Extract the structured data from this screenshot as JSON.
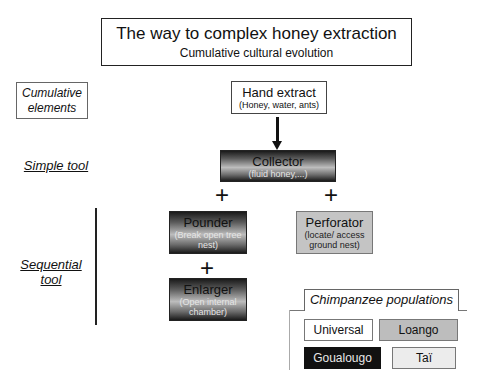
{
  "header": {
    "title": "The way to complex honey extraction",
    "subtitle": "Cumulative cultural evolution"
  },
  "side_labels": {
    "cumulative_elements_line1": "Cumulative",
    "cumulative_elements_line2": "elements",
    "simple_tool": "Simple tool",
    "sequential_tool_line1": "Sequential",
    "sequential_tool_line2": "tool"
  },
  "nodes": {
    "hand_extract": {
      "title": "Hand extract",
      "sub": "(Honey, water, ants)",
      "population": "Universal"
    },
    "collector": {
      "title": "Collector",
      "sub": "(fluid honey,...)",
      "population": "Taï / gradient"
    },
    "pounder": {
      "title": "Pounder",
      "sub_line1": "(Break open tree",
      "sub_line2": "nest)"
    },
    "perforator": {
      "title": "Perforator",
      "sub_line1": "(locate/ access",
      "sub_line2": "ground nest)",
      "population": "Loango"
    },
    "enlarger": {
      "title": "Enlarger",
      "sub_line1": "(Open internal",
      "sub_line2": "chamber)"
    }
  },
  "connectors": {
    "plus_symbol": "+"
  },
  "legend": {
    "title": "Chimpanzee populations",
    "items": [
      {
        "label": "Universal",
        "fill": "#ffffff",
        "text": "#111111"
      },
      {
        "label": "Loango",
        "fill": "#bdbdbd",
        "text": "#111111"
      },
      {
        "label": "Goualougo",
        "fill": "#111111",
        "text": "#e8e8e8"
      },
      {
        "label": "Taï",
        "fill": "#ececec",
        "text": "#111111"
      }
    ]
  }
}
